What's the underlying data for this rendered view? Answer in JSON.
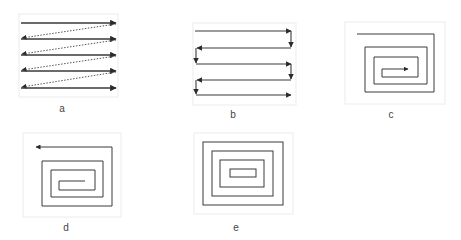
{
  "colors": {
    "line": "#3a3a3a",
    "frame": "#ececec",
    "dotted": "#555555"
  },
  "panels": [
    {
      "id": "a",
      "label": "a",
      "description": "raster scan with dotted return diagonals"
    },
    {
      "id": "b",
      "label": "b",
      "description": "serpentine / boustrophedon scan"
    },
    {
      "id": "c",
      "label": "c",
      "description": "inward rectangular spiral"
    },
    {
      "id": "d",
      "label": "d",
      "description": "outward rectangular spiral"
    },
    {
      "id": "e",
      "label": "e",
      "description": "concentric rectangles"
    }
  ]
}
